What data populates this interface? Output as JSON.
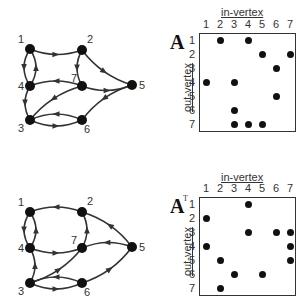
{
  "graphs": [
    {
      "id": "graph-A",
      "nodes": [
        {
          "id": "1",
          "x": 30,
          "y": 49
        },
        {
          "id": "2",
          "x": 82,
          "y": 50
        },
        {
          "id": "3",
          "x": 30,
          "y": 120
        },
        {
          "id": "4",
          "x": 30,
          "y": 86
        },
        {
          "id": "5",
          "x": 132,
          "y": 85
        },
        {
          "id": "6",
          "x": 82,
          "y": 120
        },
        {
          "id": "7",
          "x": 82,
          "y": 86
        }
      ],
      "edges": [
        [
          "1",
          "2"
        ],
        [
          "1",
          "4"
        ],
        [
          "4",
          "1"
        ],
        [
          "2",
          "5"
        ],
        [
          "2",
          "7"
        ],
        [
          "7",
          "4"
        ],
        [
          "7",
          "5"
        ],
        [
          "7",
          "3"
        ],
        [
          "4",
          "3"
        ],
        [
          "3",
          "6"
        ],
        [
          "6",
          "3"
        ],
        [
          "5",
          "6"
        ]
      ]
    },
    {
      "id": "graph-AT",
      "nodes": [
        {
          "id": "1",
          "x": 30,
          "y": 212
        },
        {
          "id": "2",
          "x": 82,
          "y": 212
        },
        {
          "id": "3",
          "x": 30,
          "y": 283
        },
        {
          "id": "4",
          "x": 30,
          "y": 248
        },
        {
          "id": "5",
          "x": 132,
          "y": 247
        },
        {
          "id": "6",
          "x": 82,
          "y": 283
        },
        {
          "id": "7",
          "x": 82,
          "y": 248
        }
      ],
      "edges": [
        [
          "2",
          "1"
        ],
        [
          "4",
          "1"
        ],
        [
          "1",
          "4"
        ],
        [
          "5",
          "2"
        ],
        [
          "7",
          "2"
        ],
        [
          "4",
          "7"
        ],
        [
          "5",
          "7"
        ],
        [
          "3",
          "7"
        ],
        [
          "3",
          "4"
        ],
        [
          "6",
          "3"
        ],
        [
          "3",
          "6"
        ],
        [
          "6",
          "5"
        ]
      ]
    }
  ],
  "matrices": [
    {
      "id": "A",
      "title": "A",
      "superscript": "",
      "col_axis_label": "in-vertex",
      "row_axis_label": "out-vertex",
      "cols": [
        "1",
        "2",
        "3",
        "4",
        "5",
        "6",
        "7"
      ],
      "rows": [
        "1",
        "2",
        "3",
        "4",
        "5",
        "6",
        "7"
      ],
      "entries": [
        [
          1,
          2
        ],
        [
          1,
          4
        ],
        [
          2,
          5
        ],
        [
          2,
          7
        ],
        [
          3,
          6
        ],
        [
          4,
          1
        ],
        [
          4,
          3
        ],
        [
          5,
          6
        ],
        [
          6,
          3
        ],
        [
          7,
          3
        ],
        [
          7,
          4
        ],
        [
          7,
          5
        ]
      ]
    },
    {
      "id": "AT",
      "title": "A",
      "superscript": "T",
      "col_axis_label": "in-vertex",
      "row_axis_label": "out-vertex",
      "cols": [
        "1",
        "2",
        "3",
        "4",
        "5",
        "6",
        "7"
      ],
      "rows": [
        "1",
        "2",
        "3",
        "4",
        "5",
        "6",
        "7"
      ],
      "entries": [
        [
          1,
          4
        ],
        [
          2,
          1
        ],
        [
          3,
          4
        ],
        [
          3,
          6
        ],
        [
          3,
          7
        ],
        [
          4,
          1
        ],
        [
          4,
          7
        ],
        [
          5,
          2
        ],
        [
          5,
          7
        ],
        [
          6,
          3
        ],
        [
          6,
          5
        ],
        [
          7,
          2
        ]
      ]
    }
  ],
  "colors": {
    "ink": "#1a1a1a",
    "edge": "#333333"
  }
}
